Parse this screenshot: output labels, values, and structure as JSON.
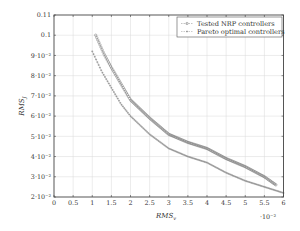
{
  "chart_data": {
    "type": "scatter",
    "title": "",
    "xlabel": "RMS_v",
    "ylabel": "RMS_J",
    "x_multiplier": "·10⁻²",
    "xlim": [
      0,
      6
    ],
    "ylim": [
      0.02,
      0.11
    ],
    "grid": true,
    "legend_position": "upper right",
    "x_ticks": [
      "0",
      "0.5",
      "1",
      "1.5",
      "2",
      "2.5",
      "3",
      "3.5",
      "4",
      "4.5",
      "5",
      "5.5",
      "6"
    ],
    "y_ticks": [
      "2·10⁻²",
      "3·10⁻²",
      "4·10⁻²",
      "5·10⁻²",
      "6·10⁻²",
      "7·10⁻²",
      "8·10⁻²",
      "9·10⁻²",
      "0.1",
      "0.11"
    ],
    "series": [
      {
        "name": "Tested NRP controllers",
        "marker": "circle",
        "color": "#888888",
        "x": [
          1.09,
          1.3,
          1.5,
          1.75,
          2.0,
          2.5,
          3.0,
          3.5,
          4.0,
          4.5,
          5.0,
          5.5,
          5.8
        ],
        "y": [
          0.1,
          0.091,
          0.084,
          0.076,
          0.068,
          0.059,
          0.051,
          0.047,
          0.044,
          0.039,
          0.035,
          0.03,
          0.026
        ]
      },
      {
        "name": "Pareto optimal controllers",
        "marker": "plus",
        "color": "#999999",
        "x": [
          1.0,
          1.25,
          1.5,
          1.75,
          2.0,
          2.5,
          3.0,
          3.5,
          4.0,
          4.5,
          5.0,
          5.5,
          6.0
        ],
        "y": [
          0.092,
          0.082,
          0.074,
          0.066,
          0.06,
          0.051,
          0.044,
          0.04,
          0.037,
          0.032,
          0.028,
          0.025,
          0.022
        ]
      }
    ]
  }
}
